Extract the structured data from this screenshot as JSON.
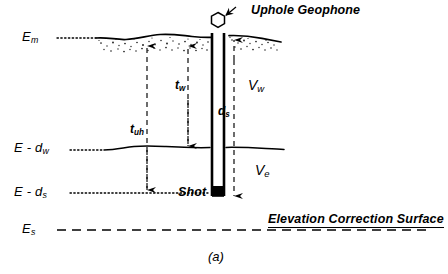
{
  "figure": {
    "caption": "(a)",
    "title_annotation": "Uphole Geophone",
    "shot_label": "Shot",
    "correction_surface_label": "Elevation Correction Surface"
  },
  "elevation_labels": [
    {
      "id": "surface",
      "base": "E",
      "sub": "m",
      "text": "E",
      "subscript": "m"
    },
    {
      "id": "weathering-base",
      "base": "E - d",
      "sub": "w",
      "text": "E - d",
      "subscript": "w"
    },
    {
      "id": "shot-depth",
      "base": "E - d",
      "sub": "s",
      "text": "E - d",
      "subscript": "s"
    },
    {
      "id": "datum",
      "base": "E",
      "sub": "s",
      "text": "E",
      "subscript": "s"
    }
  ],
  "time_labels": [
    {
      "id": "uphole-time",
      "text": "t",
      "subscript": "uh"
    },
    {
      "id": "weathering-time",
      "text": "t",
      "subscript": "w"
    }
  ],
  "depth_labels": [
    {
      "id": "shot-depth-dim",
      "text": "d",
      "subscript": "s"
    }
  ],
  "velocity_labels": [
    {
      "id": "weathering-velocity",
      "text": "V",
      "subscript": "w"
    },
    {
      "id": "subweathering-velocity",
      "text": "V",
      "subscript": "e"
    }
  ],
  "colors": {
    "ink": "#000000",
    "background": "#ffffff"
  },
  "icons": {
    "geophone": "geophone-icon",
    "shot_charge": "shot-charge-icon"
  }
}
